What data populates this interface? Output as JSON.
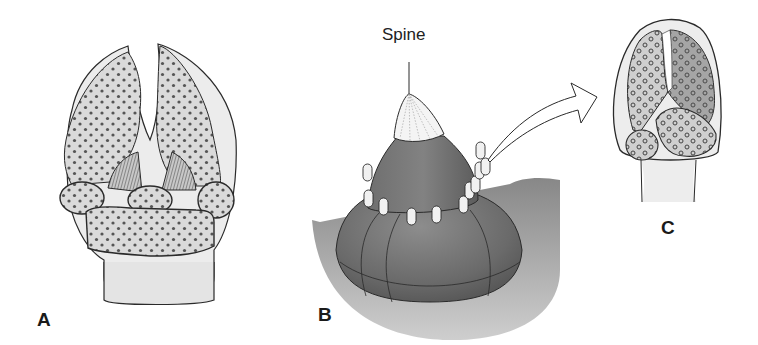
{
  "figure": {
    "panels": [
      {
        "id": "A",
        "label": "A"
      },
      {
        "id": "B",
        "label": "B",
        "callouts": [
          {
            "label": "Spine"
          }
        ]
      },
      {
        "id": "C",
        "label": "C"
      }
    ]
  },
  "colors": {
    "background": "#ffffff",
    "outline": "#2a2a2a",
    "pale_tissue": "#e9e9e9",
    "stippled_tissue": "#d6d6d6",
    "body_dark": "#6e6e6e",
    "body_mid": "#8a8a8a",
    "spine_tip": "#f4f4f4"
  }
}
